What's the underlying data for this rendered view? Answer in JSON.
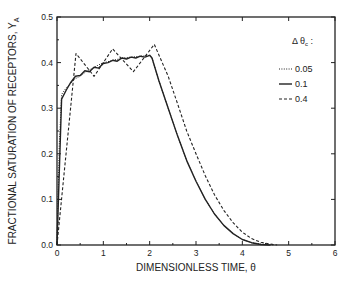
{
  "chart_data": {
    "type": "line",
    "title": "",
    "xlabel": "DIMENSIONLESS TIME, θ",
    "ylabel": "FRACTIONAL SATURATION OF RECEPTORS, Y",
    "ylabel_subscript": "A",
    "xlim": [
      0,
      6
    ],
    "ylim": [
      0,
      0.5
    ],
    "x_ticks": [
      0,
      1,
      2,
      3,
      4,
      5,
      6
    ],
    "x_tick_labels": [
      "0",
      "1",
      "2",
      "3",
      "4",
      "5",
      "6"
    ],
    "y_ticks": [
      0.0,
      0.1,
      0.2,
      0.3,
      0.4,
      0.5
    ],
    "y_tick_labels": [
      "0.0",
      "0.1",
      "0.2",
      "0.3",
      "0.4",
      "0.5"
    ],
    "grid": false,
    "legend": {
      "title": "Δ θ",
      "title_subscript": "c",
      "title_suffix": " :",
      "placement": "right"
    },
    "series": [
      {
        "name": "0.05",
        "style": "dotted",
        "x": [
          0,
          0.05,
          0.1,
          0.2,
          0.3,
          0.4,
          0.5,
          0.6,
          0.7,
          0.8,
          0.9,
          1.0,
          1.1,
          1.2,
          1.3,
          1.4,
          1.5,
          1.6,
          1.7,
          1.8,
          1.9,
          2.0,
          2.05,
          2.2,
          2.4,
          2.6,
          2.8,
          3.0,
          3.2,
          3.4,
          3.6,
          3.8,
          4.0,
          4.2,
          4.4,
          4.6,
          4.7
        ],
        "y": [
          0,
          0.22,
          0.33,
          0.345,
          0.355,
          0.365,
          0.37,
          0.378,
          0.384,
          0.39,
          0.395,
          0.4,
          0.402,
          0.405,
          0.407,
          0.41,
          0.411,
          0.412,
          0.413,
          0.414,
          0.415,
          0.416,
          0.41,
          0.36,
          0.3,
          0.24,
          0.185,
          0.14,
          0.1,
          0.068,
          0.043,
          0.025,
          0.012,
          0.005,
          0.002,
          0.0005,
          0
        ]
      },
      {
        "name": "0.1",
        "style": "solid",
        "x": [
          0,
          0.1,
          0.2,
          0.3,
          0.4,
          0.5,
          0.6,
          0.7,
          0.8,
          0.9,
          1.0,
          1.1,
          1.2,
          1.3,
          1.4,
          1.5,
          1.6,
          1.7,
          1.8,
          1.9,
          2.0,
          2.05,
          2.2,
          2.4,
          2.6,
          2.8,
          3.0,
          3.2,
          3.4,
          3.6,
          3.8,
          4.0,
          4.2,
          4.4,
          4.6
        ],
        "y": [
          0,
          0.32,
          0.34,
          0.357,
          0.37,
          0.372,
          0.382,
          0.38,
          0.39,
          0.388,
          0.398,
          0.4,
          0.405,
          0.403,
          0.41,
          0.408,
          0.412,
          0.41,
          0.414,
          0.412,
          0.416,
          0.41,
          0.36,
          0.3,
          0.24,
          0.185,
          0.14,
          0.1,
          0.068,
          0.043,
          0.025,
          0.012,
          0.005,
          0.001,
          0
        ]
      },
      {
        "name": "0.4",
        "style": "dashed",
        "x": [
          0,
          0.41,
          0.8,
          1.2,
          1.65,
          2.1,
          2.4,
          2.6,
          2.8,
          3.0,
          3.2,
          3.4,
          3.6,
          3.8,
          4.0,
          4.2,
          4.4,
          4.6,
          4.75
        ],
        "y": [
          0,
          0.42,
          0.37,
          0.43,
          0.38,
          0.44,
          0.37,
          0.31,
          0.25,
          0.2,
          0.152,
          0.11,
          0.076,
          0.049,
          0.028,
          0.014,
          0.006,
          0.002,
          0
        ]
      }
    ]
  }
}
